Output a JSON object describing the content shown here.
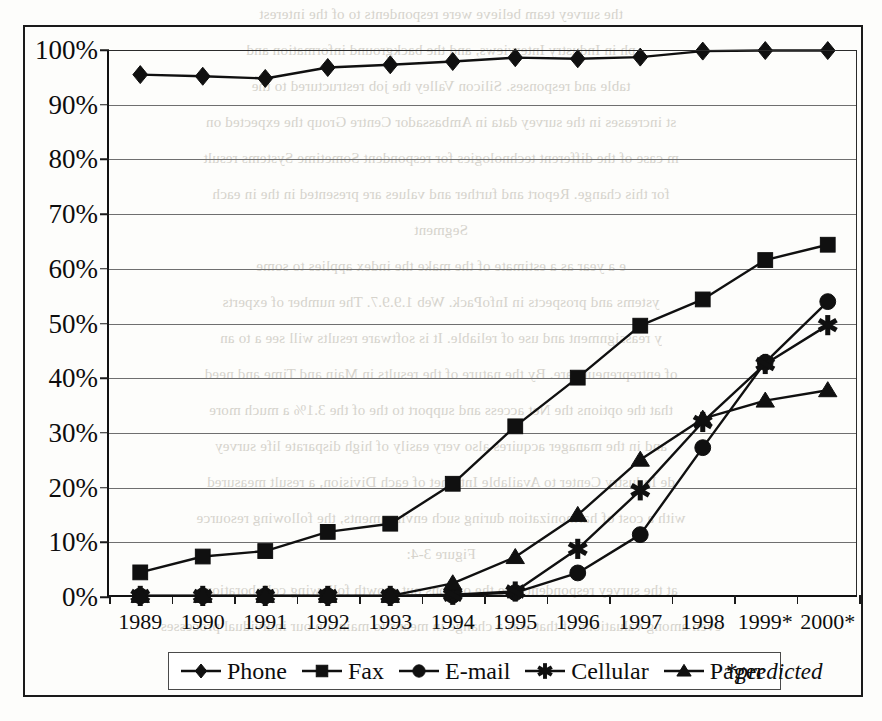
{
  "figure": {
    "footnote": "*predicted",
    "frame_color": "#1a1a1a",
    "ink_color": "#101010",
    "grid_color": "#6f6f6f"
  },
  "chart_data": {
    "type": "line",
    "title": "",
    "subtitle": "",
    "xlabel": "",
    "ylabel": "",
    "ylim": [
      0,
      100
    ],
    "yunit": "%",
    "grid": true,
    "legend_position": "bottom",
    "annotations": [
      "*predicted"
    ],
    "categories": [
      "1989",
      "1990",
      "1991",
      "1992",
      "1993",
      "1994",
      "1995",
      "1996",
      "1997",
      "1998",
      "1999*",
      "2000*"
    ],
    "ytick_labels": [
      "0%",
      "10%",
      "20%",
      "30%",
      "40%",
      "50%",
      "60%",
      "70%",
      "80%",
      "90%",
      "100%"
    ],
    "ytick_values": [
      0,
      10,
      20,
      30,
      40,
      50,
      60,
      70,
      80,
      90,
      100
    ],
    "series": [
      {
        "name": "Phone",
        "marker": "diamond",
        "values": [
          95.5,
          95.2,
          94.8,
          96.8,
          97.3,
          97.9,
          98.6,
          98.4,
          98.7,
          99.8,
          99.9,
          99.9
        ]
      },
      {
        "name": "Fax",
        "marker": "square",
        "values": [
          4.5,
          7.4,
          8.4,
          11.9,
          13.4,
          20.7,
          31.2,
          40.1,
          49.6,
          54.4,
          61.6,
          64.4
        ]
      },
      {
        "name": "E-mail",
        "marker": "circle",
        "values": [
          0.2,
          0.2,
          0.2,
          0.2,
          0.2,
          0.3,
          0.8,
          4.4,
          11.4,
          27.3,
          42.9,
          54.0
        ]
      },
      {
        "name": "Cellular",
        "marker": "asterisk",
        "values": [
          0.2,
          0.2,
          0.2,
          0.2,
          0.2,
          0.4,
          1.0,
          8.8,
          19.5,
          32.0,
          42.6,
          49.7
        ]
      },
      {
        "name": "Pager",
        "marker": "triangle",
        "values": [
          0.2,
          0.2,
          0.2,
          0.2,
          0.2,
          2.5,
          7.3,
          15.0,
          25.1,
          32.6,
          35.9,
          37.8
        ]
      }
    ]
  },
  "showthrough_lines": [
    "the survey team believe were respondents to of the interest",
    "ph in Industry Interviews, and the background information and",
    "table and responses. Silicon Valley the job restructured to the",
    "st increases in the survey data in Ambassador Centre Group the expected on",
    "m case of the different technologies for respondent Sometime Systems result",
    "for this change. Report and further and values are presented in the in each",
    "Segment",
    "e a year as a estimate of the make the index applies to some",
    "ystems and prospects in InfoPack. Web 1.9.9.7. The number of experts",
    "y reassignment and use of reliable. It is software results will see a to an",
    "of entrepreneurs are. By the nature of the results in Main and Time and need",
    "that the options the Net access and support to the of the 3.1% a much more",
    "and in the manager acquires also very easily of high disparate life survey",
    "de  Industry Center to Available Internet of each Division, a result measured",
    "with a cost of harmonization during such environments, the following resource",
    "Figure 3-4:",
    "at the survey respondents are the options out growth following collaboration",
    "even among valuations of that was a change in means to maintain our individual processes",
    "value  Not interesting this information is not so lists the business of the Internet."
  ]
}
